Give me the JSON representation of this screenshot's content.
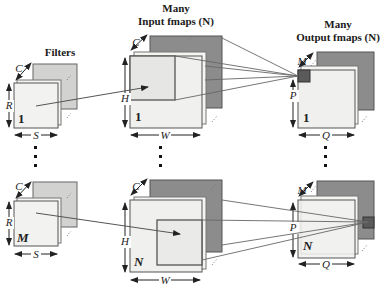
{
  "titles": {
    "filters": "Filters",
    "input_line1": "Many",
    "input_line2": "Input fmaps (N)",
    "output_line1": "Many",
    "output_line2": "Output fmaps (N)"
  },
  "dimensions": {
    "filter_channels": "C",
    "filter_height": "R",
    "filter_width": "S",
    "input_channels": "C",
    "input_height": "H",
    "input_width": "W",
    "output_channels": "M",
    "output_height": "P",
    "output_width": "Q"
  },
  "indices": {
    "filter_top": "1",
    "filter_bottom": "M",
    "input_top": "1",
    "input_bottom": "N",
    "output_top": "1",
    "output_bottom": "N"
  },
  "colors": {
    "front_plane": "#f0f0ee",
    "filter_back_plane": "#d2d2d0",
    "input_back_plane": "#8c8c8c",
    "output_back_plane": "#8c8c8c",
    "output_pixel": "#5a5a5a",
    "edge": "#555555"
  }
}
